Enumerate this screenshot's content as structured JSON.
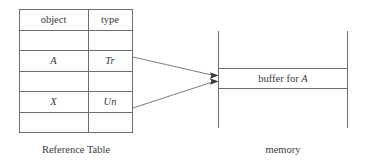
{
  "figure": {
    "title_hidden": "",
    "stroke_color": "#6e6e6e",
    "text_color": "#3a3a3a",
    "background": "#ffffff"
  },
  "reference_table": {
    "caption": "Reference Table",
    "columns": [
      "object",
      "type"
    ],
    "rows": [
      {
        "object": "object",
        "type": "type",
        "header": true
      },
      {
        "object": "",
        "type": ""
      },
      {
        "object": "A",
        "type": "Tr"
      },
      {
        "object": "",
        "type": ""
      },
      {
        "object": "X",
        "type": "Un"
      },
      {
        "object": "",
        "type": ""
      }
    ]
  },
  "memory": {
    "caption": "memory",
    "buffer_label_prefix": "buffer for ",
    "buffer_label_var": "A"
  },
  "arrows": [
    {
      "from": "type-cell-Tr",
      "to": "memory-buffer-top"
    },
    {
      "from": "type-cell-Un",
      "to": "memory-buffer-bottom"
    }
  ]
}
